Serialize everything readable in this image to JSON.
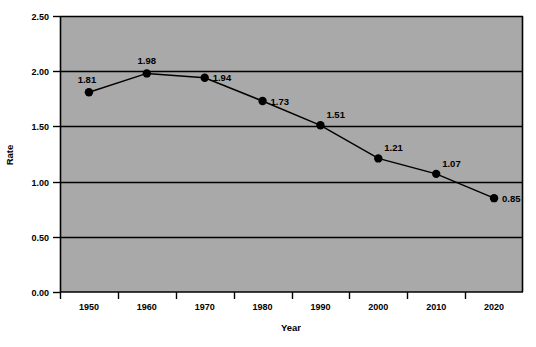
{
  "chart_data": {
    "type": "line",
    "title": "",
    "xlabel": "Year",
    "ylabel": "Rate",
    "categories": [
      "1950",
      "1960",
      "1970",
      "1980",
      "1990",
      "2000",
      "2010",
      "2020"
    ],
    "x": [
      1950,
      1960,
      1970,
      1980,
      1990,
      2000,
      2010,
      2020
    ],
    "values": [
      1.81,
      1.98,
      1.94,
      1.73,
      1.51,
      1.21,
      1.07,
      0.85
    ],
    "point_labels": [
      "1.81",
      "1.98",
      "1.94",
      "1.73",
      "1.51",
      "1.21",
      "1.07",
      "0.85"
    ],
    "label_positions": [
      "above-left",
      "above",
      "right",
      "right",
      "above-right",
      "above-right",
      "above-right",
      "right"
    ],
    "ylim": [
      0.0,
      2.5
    ],
    "ytick_labels": [
      "0.00",
      "0.50",
      "1.00",
      "1.50",
      "2.00",
      "2.50"
    ],
    "ytick_values": [
      0.0,
      0.5,
      1.0,
      1.5,
      2.0,
      2.5
    ],
    "grid": true,
    "grid_axis": "y",
    "legend": "none",
    "marker": "filled-circle",
    "colors": {
      "plot_background": "#a9a9a9",
      "line": "#000000",
      "marker": "#000000",
      "grid": "#000000",
      "axis": "#000000",
      "text": "#000000",
      "figure_background": "#ffffff"
    }
  },
  "axes": {
    "y_title": "Rate",
    "x_title": "Year"
  }
}
